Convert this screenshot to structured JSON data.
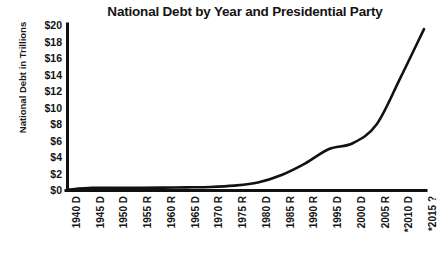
{
  "chart_data": {
    "type": "line",
    "title": "National Debt by Year and Presidential Party",
    "xlabel": "",
    "ylabel": "National Debt in Trillions",
    "ylim": [
      0,
      20
    ],
    "ytick_labels": [
      "$20",
      "$18",
      "$16",
      "$14",
      "$12",
      "$10",
      "$8",
      "$6",
      "$4",
      "$2",
      "$0"
    ],
    "ytick_values": [
      20,
      18,
      16,
      14,
      12,
      10,
      8,
      6,
      4,
      2,
      0
    ],
    "grid": false,
    "legend": "none",
    "line_color": "#111111",
    "categories": [
      "1940 D",
      "1945 D",
      "1950 D",
      "1955 R",
      "1960 R",
      "1965 D",
      "1970 R",
      "1975 R",
      "1980 D",
      "1985 R",
      "1990 R",
      "1995 D",
      "2000 D",
      "2005 R",
      "*2010 D",
      "*2015 ?"
    ],
    "values": [
      0.05,
      0.26,
      0.26,
      0.27,
      0.29,
      0.32,
      0.37,
      0.53,
      0.91,
      1.82,
      3.23,
      4.97,
      5.67,
      7.93,
      13.56,
      19.5
    ],
    "series": [
      {
        "name": "National Debt",
        "values": [
          0.05,
          0.26,
          0.26,
          0.27,
          0.29,
          0.32,
          0.37,
          0.53,
          0.91,
          1.82,
          3.23,
          4.97,
          5.67,
          7.93,
          13.56,
          19.5
        ]
      }
    ]
  }
}
